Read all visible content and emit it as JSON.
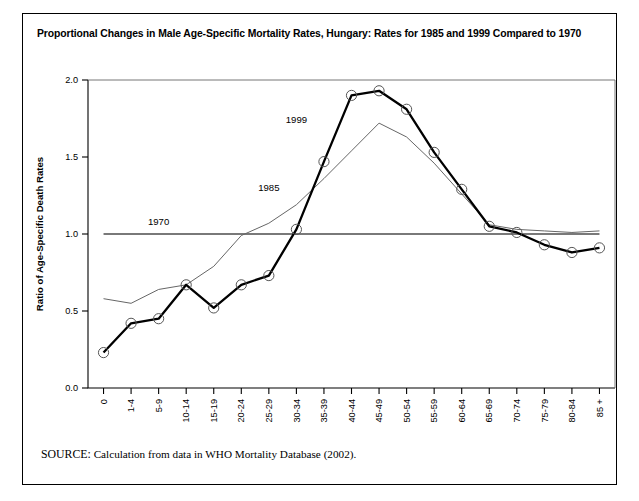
{
  "figure": {
    "title": "Proportional Changes in Male Age-Specific Mortality Rates, Hungary: Rates for 1985 and 1999 Compared to 1970",
    "source_label": "SOURCE:",
    "source_text": "Calculation from data in WHO Mortality Database (2002)."
  },
  "chart_data": {
    "type": "line",
    "title": "Proportional Changes in Male Age-Specific Mortality Rates, Hungary: Rates for 1985 and 1999 Compared to 1970",
    "xlabel": "Age (Years)",
    "ylabel": "Ratio of Age-Specific Death Rates",
    "categories": [
      "0",
      "1-4",
      "5-9",
      "10-14",
      "15-19",
      "20-24",
      "25-29",
      "30-34",
      "35-39",
      "40-44",
      "45-49",
      "50-54",
      "55-59",
      "60-64",
      "65-69",
      "70-74",
      "75-79",
      "80-84",
      "85 +"
    ],
    "ylim": [
      0.0,
      2.0
    ],
    "yticks": [
      0.0,
      0.5,
      1.0,
      1.5,
      2.0
    ],
    "ytick_labels": [
      "0.0",
      "0.5",
      "1.0",
      "1.5",
      "2.0"
    ],
    "grid": false,
    "legend": "inline-labels",
    "series": [
      {
        "name": "1970",
        "label": "1970",
        "style": "reference-line",
        "marker": "none",
        "color": "#4d4d4d",
        "values": [
          1.0,
          1.0,
          1.0,
          1.0,
          1.0,
          1.0,
          1.0,
          1.0,
          1.0,
          1.0,
          1.0,
          1.0,
          1.0,
          1.0,
          1.0,
          1.0,
          1.0,
          1.0,
          1.0
        ]
      },
      {
        "name": "1985",
        "label": "1985",
        "style": "thin-line",
        "marker": "none",
        "color": "#666666",
        "values": [
          0.58,
          0.55,
          0.64,
          0.67,
          0.79,
          0.99,
          1.07,
          1.19,
          1.36,
          1.54,
          1.72,
          1.63,
          1.46,
          1.26,
          1.06,
          1.03,
          1.02,
          1.01,
          1.02
        ]
      },
      {
        "name": "1999",
        "label": "1999",
        "style": "thick-line",
        "marker": "open-circle",
        "color": "#000000",
        "values": [
          0.23,
          0.42,
          0.45,
          0.67,
          0.52,
          0.67,
          0.73,
          1.03,
          1.47,
          1.9,
          1.93,
          1.81,
          1.53,
          1.29,
          1.05,
          1.01,
          0.93,
          0.88,
          0.91
        ]
      }
    ],
    "annotations": [
      {
        "text": "1970",
        "category": "5-9",
        "value": 1.06
      },
      {
        "text": "1985",
        "category": "25-29",
        "value": 1.28
      },
      {
        "text": "1999",
        "category": "30-34",
        "value": 1.72
      }
    ]
  }
}
